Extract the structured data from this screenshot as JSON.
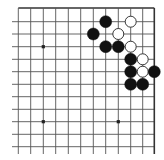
{
  "diagram": {
    "type": "go-board-fragment",
    "corner": "top-right",
    "colors": {
      "background": "#ffffff",
      "line": "#555555",
      "border": "#333333",
      "black_stone": "#111111",
      "white_stone_fill": "#ffffff",
      "white_stone_edge": "#222222",
      "star_point": "#222222"
    },
    "grid": {
      "columns": 12,
      "rows": 12,
      "x": [
        18.3,
        30.7,
        43.3,
        55.7,
        68.3,
        80.7,
        93.3,
        105.7,
        118.3,
        130.7,
        142.7,
        154.3
      ],
      "y": [
        8,
        21.7,
        34,
        46.7,
        59.3,
        71.7,
        84.3,
        96.7,
        109.3,
        121.7,
        134.3,
        146.7
      ],
      "left_stub_to": 12,
      "bottom_stub_to": 154,
      "border_edges": [
        "top",
        "right"
      ]
    },
    "star_points": [
      {
        "col": 2,
        "row": 3
      },
      {
        "col": 2,
        "row": 9
      },
      {
        "col": 8,
        "row": 9
      }
    ],
    "stones": [
      {
        "color": "black",
        "col": 7,
        "row": 1
      },
      {
        "color": "white",
        "col": 9,
        "row": 1
      },
      {
        "color": "black",
        "col": 6,
        "row": 2
      },
      {
        "color": "white",
        "col": 8,
        "row": 2
      },
      {
        "color": "black",
        "col": 7,
        "row": 3
      },
      {
        "color": "black",
        "col": 8,
        "row": 3
      },
      {
        "color": "white",
        "col": 9,
        "row": 3
      },
      {
        "color": "black",
        "col": 9,
        "row": 4
      },
      {
        "color": "white",
        "col": 10,
        "row": 4
      },
      {
        "color": "black",
        "col": 9,
        "row": 5
      },
      {
        "color": "white",
        "col": 10,
        "row": 5
      },
      {
        "color": "black",
        "col": 11,
        "row": 5
      },
      {
        "color": "black",
        "col": 9,
        "row": 6
      },
      {
        "color": "black",
        "col": 10,
        "row": 6
      }
    ],
    "stone_radius": 6
  }
}
